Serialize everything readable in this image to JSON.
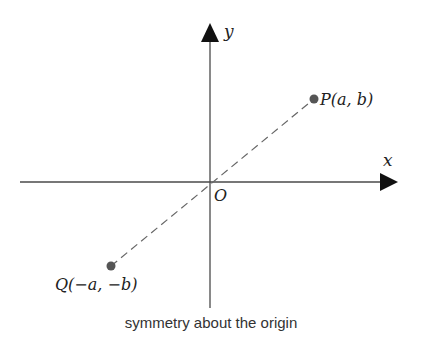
{
  "diagram": {
    "caption": "symmetry about the origin",
    "axes": {
      "x_label": "x",
      "y_label": "y",
      "origin_label": "O"
    },
    "points": [
      {
        "id": "P",
        "label": "P(a, b)",
        "name": "P",
        "coords": "(a, b)"
      },
      {
        "id": "Q",
        "label": "Q(−a, −b)",
        "name": "Q",
        "coords": "(−a, −b)"
      }
    ],
    "colors": {
      "axis": "#4a4a4a",
      "point": "#555555",
      "dash": "#666666"
    }
  }
}
